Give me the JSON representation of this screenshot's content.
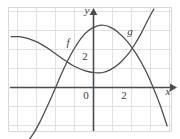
{
  "figure": {
    "kind": "cartesian-graph",
    "width": 180,
    "height": 139,
    "background_color": "#ffffff",
    "frame": {
      "visible": true,
      "color": "#d8d8d8",
      "x": 8,
      "y": 7,
      "width": 164,
      "height": 125
    }
  },
  "grid": {
    "visible": true,
    "color": "#dcdce4",
    "spacing_px": 19,
    "vertical_lines_x": [
      17,
      36,
      55,
      74,
      93,
      112,
      131,
      150,
      169
    ],
    "horizontal_lines_y": [
      11,
      30,
      49,
      68,
      87,
      106,
      125
    ]
  },
  "axes": {
    "color": "#4d4d4d",
    "origin_px": {
      "x": 93,
      "y": 87
    },
    "unit_px": {
      "x": 19,
      "y": 19
    },
    "x_axis": {
      "label": "x",
      "label_pos_px": {
        "x": 168,
        "y": 95
      },
      "y_px": 87,
      "start_px": 10,
      "end_px": 175,
      "arrow": "right"
    },
    "y_axis": {
      "label": "y",
      "label_pos_px": {
        "x": 87,
        "y": 14
      },
      "x_px": 93,
      "start_px": 131,
      "end_px": 9,
      "arrow": "up"
    }
  },
  "tick_labels": [
    {
      "text": "0",
      "axis": "origin",
      "pos_px": {
        "x": 86,
        "y": 99
      }
    },
    {
      "text": "2",
      "axis": "x",
      "pos_px": {
        "x": 124,
        "y": 99
      }
    },
    {
      "text": "2",
      "axis": "y",
      "pos_px": {
        "x": 85,
        "y": 60
      }
    }
  ],
  "curve_labels": [
    {
      "text": "f",
      "pos_px": {
        "x": 68,
        "y": 46
      },
      "for_curve": "f"
    },
    {
      "text": "g",
      "pos_px": {
        "x": 130,
        "y": 35
      },
      "for_curve": "g"
    }
  ],
  "chart_data": {
    "type": "line",
    "title": "",
    "xlabel": "x",
    "ylabel": "y",
    "xlim": [
      -4.4,
      4.3
    ],
    "ylim": [
      -4.0,
      4.1
    ],
    "grid": true,
    "legend": "inline-curve-labels",
    "curve_color": "#4a4a4a",
    "series": [
      {
        "name": "f",
        "label": "f",
        "description": "Cubic-shaped curve rising from lower left, inflecting upward, reaching a local maximum near x = 0.5, then falling steeply to the lower right.",
        "points": [
          {
            "x": -3.95,
            "y": -3.25
          },
          {
            "x": -3.6,
            "y": -3.05
          },
          {
            "x": -3.2,
            "y": -2.55
          },
          {
            "x": -2.8,
            "y": -1.85
          },
          {
            "x": -2.4,
            "y": -1.0
          },
          {
            "x": -2.0,
            "y": -0.1
          },
          {
            "x": -1.7,
            "y": 0.6
          },
          {
            "x": -1.4,
            "y": 1.25
          },
          {
            "x": -1.0,
            "y": 2.0
          },
          {
            "x": -0.6,
            "y": 2.6
          },
          {
            "x": -0.2,
            "y": 3.0
          },
          {
            "x": 0.2,
            "y": 3.2
          },
          {
            "x": 0.55,
            "y": 3.25
          },
          {
            "x": 0.9,
            "y": 3.15
          },
          {
            "x": 1.3,
            "y": 2.9
          },
          {
            "x": 1.8,
            "y": 2.4
          },
          {
            "x": 2.3,
            "y": 1.7
          },
          {
            "x": 2.8,
            "y": 0.8
          },
          {
            "x": 3.2,
            "y": -0.1
          },
          {
            "x": 3.55,
            "y": -1.0
          },
          {
            "x": 3.9,
            "y": -2.05
          }
        ]
      },
      {
        "name": "g",
        "label": "g",
        "description": "Curve entering from the upper left, decreasing to a local minimum near x = 0.4, then increasing steeply to the upper right.",
        "points": [
          {
            "x": -4.3,
            "y": 2.65
          },
          {
            "x": -3.9,
            "y": 2.65
          },
          {
            "x": -3.4,
            "y": 2.55
          },
          {
            "x": -2.9,
            "y": 2.35
          },
          {
            "x": -2.4,
            "y": 2.05
          },
          {
            "x": -1.9,
            "y": 1.7
          },
          {
            "x": -1.4,
            "y": 1.35
          },
          {
            "x": -0.9,
            "y": 1.05
          },
          {
            "x": -0.4,
            "y": 0.85
          },
          {
            "x": 0.1,
            "y": 0.75
          },
          {
            "x": 0.45,
            "y": 0.75
          },
          {
            "x": 0.9,
            "y": 0.9
          },
          {
            "x": 1.4,
            "y": 1.25
          },
          {
            "x": 1.9,
            "y": 1.8
          },
          {
            "x": 2.2,
            "y": 2.25
          },
          {
            "x": 2.55,
            "y": 2.85
          },
          {
            "x": 2.9,
            "y": 3.55
          },
          {
            "x": 3.2,
            "y": 4.1
          }
        ]
      }
    ],
    "intersections": [
      {
        "x": -1.75,
        "y": 0.62,
        "note": "left crossing of f and g"
      },
      {
        "x": 2.1,
        "y": 2.05,
        "note": "right crossing of f and g"
      }
    ]
  }
}
